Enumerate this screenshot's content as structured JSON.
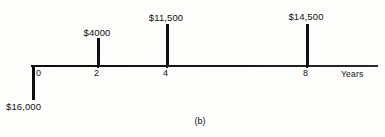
{
  "figure": {
    "caption": "(b)",
    "caption_x": 200,
    "caption_y": 116,
    "type": "cash-flow-diagram"
  },
  "axis": {
    "title": "Years",
    "title_x": 341,
    "title_y": 69,
    "baseline_y": 66,
    "start_x": 31,
    "end_x": 378,
    "tick_label_y": 68
  },
  "chart_data": {
    "type": "bar",
    "title": "(b)",
    "xlabel": "Years",
    "ylabel": "",
    "categories": [
      "0",
      "2",
      "4",
      "8"
    ],
    "values": [
      -16000,
      4000,
      11500,
      14500
    ],
    "grid": false,
    "legend": false
  },
  "flows": [
    {
      "id": "flow-year-0",
      "year_label": "0",
      "amount_label": "$16,000",
      "direction": "down",
      "x": 32,
      "tick_label_x": 36,
      "bar_top": 66,
      "bar_height": 34,
      "label_x": 6,
      "label_y": 101
    },
    {
      "id": "flow-year-2",
      "year_label": "2",
      "amount_label": "$4000",
      "direction": "up",
      "x": 97,
      "tick_label_x": 94,
      "bar_top": 38,
      "bar_height": 28,
      "label_x": 97,
      "label_y": 27
    },
    {
      "id": "flow-year-4",
      "year_label": "4",
      "amount_label": "$11,500",
      "direction": "up",
      "x": 166,
      "tick_label_x": 163,
      "bar_top": 24,
      "bar_height": 42,
      "label_x": 166,
      "label_y": 12
    },
    {
      "id": "flow-year-8",
      "year_label": "8",
      "amount_label": "$14,500",
      "direction": "up",
      "x": 306,
      "tick_label_x": 303,
      "bar_top": 24,
      "bar_height": 42,
      "label_x": 306,
      "label_y": 11
    }
  ],
  "colors": {
    "ink": "#111111",
    "background": "#fdfdfb"
  }
}
